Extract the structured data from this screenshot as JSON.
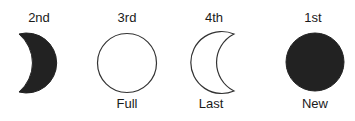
{
  "diagram": {
    "phases": [
      {
        "order": "2nd",
        "name": "",
        "shape": "waxing-crescent-filled",
        "fill": "#222222"
      },
      {
        "order": "3rd",
        "name": "Full",
        "shape": "full-circle-outline",
        "fill": "#ffffff"
      },
      {
        "order": "4th",
        "name": "Last",
        "shape": "crescent-outline",
        "fill": "#ffffff"
      },
      {
        "order": "1st",
        "name": "New",
        "shape": "new-circle-filled",
        "fill": "#222222"
      }
    ],
    "stroke_color": "#333333"
  }
}
